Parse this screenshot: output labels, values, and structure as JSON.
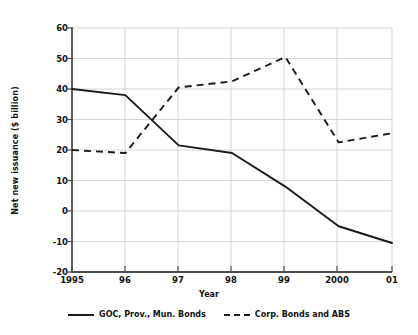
{
  "chart_data": {
    "type": "line",
    "title": "",
    "xlabel": "Year",
    "ylabel": "Net new issuance ($ billion)",
    "x": [
      "1995",
      "96",
      "97",
      "98",
      "99",
      "2000",
      "01"
    ],
    "categories": [
      "1995",
      "96",
      "97",
      "98",
      "99",
      "2000",
      "01"
    ],
    "xtick_labels": [
      "1995",
      "96",
      "97",
      "98",
      "99",
      "2000",
      "01"
    ],
    "ytick_labels": [
      "60",
      "50",
      "40",
      "30",
      "20",
      "10",
      "0",
      "-10",
      "-20"
    ],
    "ytick_values": [
      60,
      50,
      40,
      30,
      20,
      10,
      0,
      -10,
      -20
    ],
    "ylim": [
      -20,
      60
    ],
    "xlim": [
      1995,
      2001
    ],
    "grid": true,
    "legend_position": "below-axes",
    "series": [
      {
        "name": "GOC, Prov., Mun. Bonds",
        "style": "solid",
        "color": "#1a1a1a",
        "values": [
          40,
          38,
          21.5,
          19,
          8,
          -5,
          -10.5
        ]
      },
      {
        "name": "Corp. Bonds and ABS",
        "style": "dashed",
        "color": "#1a1a1a",
        "values": [
          20,
          19,
          40.5,
          42.5,
          50.5,
          22.5,
          25.5
        ]
      }
    ]
  },
  "axes": {
    "y_title": "Net new issuance ($ billion)",
    "x_title": "Year",
    "tick_color": "#555555",
    "grid_color": "#cccccc",
    "axis_color": "#4d4d4d"
  },
  "legend": {
    "items": [
      {
        "label": "GOC, Prov., Mun. Bonds",
        "style": "solid"
      },
      {
        "label": "Corp. Bonds and ABS",
        "style": "dashed"
      }
    ]
  },
  "yticks": [
    {
      "label": "60"
    },
    {
      "label": "50"
    },
    {
      "label": "40"
    },
    {
      "label": "30"
    },
    {
      "label": "20"
    },
    {
      "label": "10"
    },
    {
      "label": "0"
    },
    {
      "label": "-10"
    },
    {
      "label": "-20"
    }
  ],
  "xticks": [
    {
      "label": "1995"
    },
    {
      "label": "96"
    },
    {
      "label": "97"
    },
    {
      "label": "98"
    },
    {
      "label": "99"
    },
    {
      "label": "2000"
    },
    {
      "label": "01"
    }
  ]
}
